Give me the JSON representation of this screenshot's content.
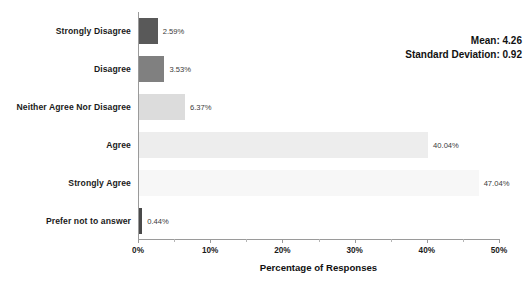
{
  "chart_data": {
    "type": "bar",
    "orientation": "horizontal",
    "title": "",
    "xlabel": "Percentage of Responses",
    "ylabel": "",
    "xlim": [
      0,
      50
    ],
    "xticks": [
      "0%",
      "10%",
      "20%",
      "30%",
      "40%",
      "50%"
    ],
    "xtick_values": [
      0,
      10,
      20,
      30,
      40,
      50
    ],
    "minor_tick_values": [
      5,
      15,
      25,
      35,
      45
    ],
    "grid": false,
    "legend": "none",
    "categories": [
      "Strongly Disagree",
      "Disagree",
      "Neither Agree Nor Disagree",
      "Agree",
      "Strongly Agree",
      "Prefer not to answer"
    ],
    "values": [
      2.59,
      3.53,
      6.37,
      40.04,
      47.04,
      0.44
    ],
    "value_labels": [
      "2.59%",
      "3.53%",
      "6.37%",
      "40.04%",
      "47.04%",
      "0.44%"
    ],
    "bar_colors": [
      "#595959",
      "#808080",
      "#dcdcdc",
      "#ededed",
      "#f7f7f7",
      "#4a4a4a"
    ],
    "annotations": {
      "mean_label": "Mean: 4.26",
      "sd_label": "Standard Deviation: 0.92",
      "mean_value": 4.26,
      "sd_value": 0.92
    }
  },
  "colors": {
    "axis": "#9a9a9a",
    "text": "#1b1b1b",
    "value_text": "#3a3a3a",
    "background": "#ffffff"
  }
}
